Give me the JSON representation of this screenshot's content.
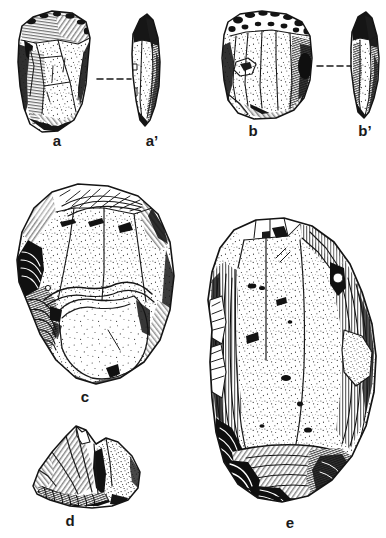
{
  "plate": {
    "title": "Lithic artifact illustration plate",
    "background_color": "#ffffff",
    "ink_color": "#1a1a1a",
    "width": 386,
    "height": 538,
    "style": "pen-and-ink stipple and hatching archaeological drawing"
  },
  "figures": [
    {
      "id": "a",
      "label": "a",
      "caption": "a",
      "description": "Core / flake tool, dorsal face view with stipple texture and hatched lateral edges",
      "label_x": 57,
      "label_y": 141,
      "view": "face"
    },
    {
      "id": "a-prime",
      "label": "a’",
      "caption": "a’",
      "description": "Profile / section view of artifact a",
      "label_x": 152,
      "label_y": 141,
      "view": "profile"
    },
    {
      "id": "b",
      "label": "b",
      "caption": "b",
      "description": "Blade core with parallel removal scars, cortical platform at top",
      "label_x": 253,
      "label_y": 131,
      "view": "face"
    },
    {
      "id": "b-prime",
      "label": "b’",
      "caption": "b’",
      "description": "Profile / section view of artifact b",
      "label_x": 365,
      "label_y": 131,
      "view": "profile"
    },
    {
      "id": "c",
      "label": "c",
      "caption": "c",
      "description": "Large discoidal / Levallois core, stippled surface with scar ridges",
      "label_x": 85,
      "label_y": 391,
      "view": "face"
    },
    {
      "id": "d",
      "label": "d",
      "caption": "d",
      "description": "Small angular fragment, hatched facets and dense basal hatching",
      "label_x": 70,
      "label_y": 515,
      "view": "face"
    },
    {
      "id": "e",
      "label": "e",
      "caption": "e",
      "description": "Large elongated core / blade blank, stippled face with hatched margins and fluted base",
      "label_x": 290,
      "label_y": 517,
      "view": "face"
    }
  ],
  "connectors": [
    {
      "name": "connector-a-to-a-prime",
      "from": "a",
      "to": "a-prime",
      "style": "dashed",
      "x1": 97,
      "x2": 131,
      "y": 79
    },
    {
      "name": "connector-b-to-b-prime",
      "from": "b",
      "to": "b-prime",
      "style": "dashed",
      "x1": 317,
      "x2": 351,
      "y": 66
    }
  ]
}
